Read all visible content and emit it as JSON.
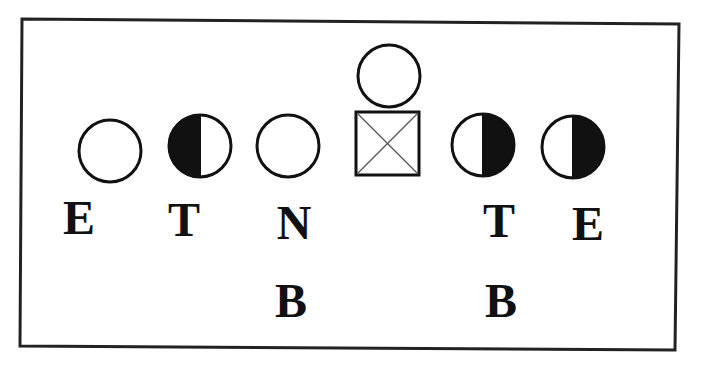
{
  "diagram": {
    "title": "",
    "frame": {
      "stroke": "#222222",
      "corners": {
        "tl": [
          22,
          19
        ],
        "tr": [
          679,
          24
        ],
        "br": [
          675,
          350
        ],
        "bl": [
          20,
          346
        ]
      }
    },
    "colors": {
      "stroke": "#111111",
      "fill_dark": "#111111",
      "fill_light": "#ffffff",
      "cross": "#555555"
    },
    "players": [
      {
        "id": "left-end",
        "shape": "circle",
        "fill": "empty",
        "cx": 110,
        "cy": 151,
        "r": 31
      },
      {
        "id": "left-tackle",
        "shape": "circle",
        "fill": "left-half",
        "cx": 200,
        "cy": 146,
        "r": 31
      },
      {
        "id": "nose",
        "shape": "circle",
        "fill": "empty",
        "cx": 288,
        "cy": 146,
        "r": 31
      },
      {
        "id": "center",
        "shape": "square-x",
        "x": 356,
        "y": 112,
        "size": 63
      },
      {
        "id": "quarterback",
        "shape": "circle",
        "fill": "empty",
        "cx": 389,
        "cy": 76,
        "r": 31
      },
      {
        "id": "right-tackle",
        "shape": "circle",
        "fill": "right-half",
        "cx": 483,
        "cy": 145,
        "r": 31
      },
      {
        "id": "right-end",
        "shape": "circle",
        "fill": "right-half",
        "cx": 573,
        "cy": 147,
        "r": 31
      }
    ],
    "labels": [
      {
        "id": "label-left-end",
        "text": "E",
        "x": 79,
        "y": 234
      },
      {
        "id": "label-left-tackle",
        "text": "T",
        "x": 184,
        "y": 236
      },
      {
        "id": "label-nose",
        "text": "N",
        "x": 294,
        "y": 239
      },
      {
        "id": "label-left-backer",
        "text": "B",
        "x": 291,
        "y": 317
      },
      {
        "id": "label-right-tackle",
        "text": "T",
        "x": 499,
        "y": 237
      },
      {
        "id": "label-right-end",
        "text": "E",
        "x": 588,
        "y": 240
      },
      {
        "id": "label-right-backer",
        "text": "B",
        "x": 501,
        "y": 317
      }
    ]
  }
}
